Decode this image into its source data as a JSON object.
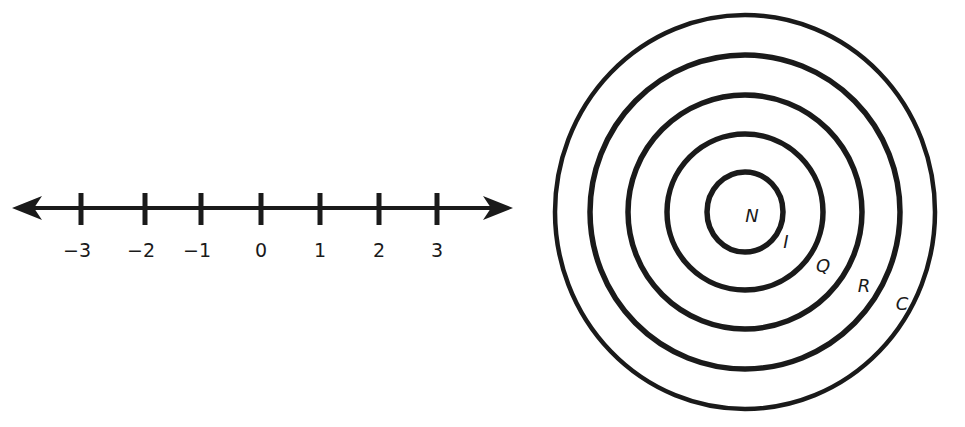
{
  "number_line": {
    "ticks": [
      {
        "label": "−3",
        "x": 81
      },
      {
        "label": "−2",
        "x": 145
      },
      {
        "label": "−1",
        "x": 201
      },
      {
        "label": "0",
        "x": 261
      },
      {
        "label": "1",
        "x": 320
      },
      {
        "label": "2",
        "x": 379
      },
      {
        "label": "3",
        "x": 437
      }
    ]
  },
  "nested_sets": {
    "labels": [
      {
        "text": "N",
        "x": 752,
        "y": 222
      },
      {
        "text": "I",
        "x": 786,
        "y": 248
      },
      {
        "text": "Q",
        "x": 823,
        "y": 272
      },
      {
        "text": "R",
        "x": 864,
        "y": 292
      },
      {
        "text": "C",
        "x": 902,
        "y": 310
      }
    ],
    "rings": [
      {
        "rx": 38,
        "ry": 40
      },
      {
        "rx": 78,
        "ry": 78
      },
      {
        "rx": 117,
        "ry": 117
      },
      {
        "rx": 155,
        "ry": 157
      },
      {
        "rx": 190,
        "ry": 197
      }
    ]
  },
  "colors": {
    "ink": "#1a1a1a",
    "background": "#ffffff"
  }
}
